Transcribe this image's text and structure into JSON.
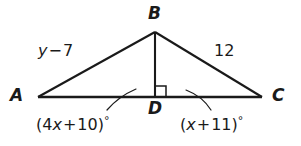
{
  "figure": {
    "kind": "geometry-triangle-diagram",
    "background_color": "#ffffff",
    "stroke_color": "#1a1a1a",
    "width": 301,
    "height": 146
  },
  "vertices": {
    "a_label": "A",
    "b_label": "B",
    "c_label": "C",
    "d_label": "D"
  },
  "sides": {
    "left_side_label": "y − 7",
    "left_side_var": "y",
    "left_side_op": "−",
    "left_side_num": "7",
    "right_side_label": "12"
  },
  "angles": {
    "left_angle_label": "(4x + 10)°",
    "left_angle_open": "(4",
    "left_angle_var": "x",
    "left_angle_op": "+",
    "left_angle_num": "10)",
    "left_angle_degree": "°",
    "right_angle_label": "(x + 11)°",
    "right_angle_open": "(",
    "right_angle_var": "x",
    "right_angle_op": "+",
    "right_angle_num": "11)",
    "right_angle_degree": "°"
  },
  "marks": {
    "right_angle_marker": "right-angle-square-at-D"
  }
}
